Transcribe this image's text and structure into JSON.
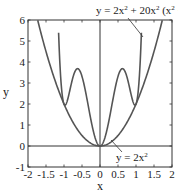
{
  "chart_data": {
    "type": "line",
    "title": "",
    "xlabel": "x",
    "ylabel": "y",
    "xlim": [
      -2,
      2
    ],
    "ylim": [
      -1,
      6
    ],
    "grid": false,
    "xticks": [
      "-2",
      "-1.5",
      "-1",
      "-0.5",
      "0",
      "0.5",
      "1",
      "1.5",
      "2"
    ],
    "yticks": [
      "-1",
      "0",
      "1",
      "2",
      "3",
      "4",
      "5",
      "6"
    ],
    "series": [
      {
        "name": "y = 2x² + 20x² (x² − 1)²",
        "expression": "2*x^2 + 20*x^2*(x^2-1)^2",
        "x": [
          -1.15,
          -1.1,
          -1.0,
          -0.9,
          -0.8,
          -0.7,
          -0.58,
          -0.5,
          -0.4,
          -0.3,
          -0.2,
          -0.1,
          0,
          0.1,
          0.2,
          0.3,
          0.4,
          0.5,
          0.58,
          0.7,
          0.8,
          0.9,
          1.0,
          1.1,
          1.15
        ],
        "values": [
          6.0,
          3.49,
          2.0,
          2.07,
          2.32,
          2.5,
          3.63,
          3.31,
          2.7,
          1.67,
          0.82,
          0.22,
          0,
          0.22,
          0.82,
          1.67,
          2.7,
          3.31,
          3.63,
          2.5,
          2.32,
          2.07,
          2.0,
          3.49,
          6.0
        ]
      },
      {
        "name": "y = 2x²",
        "expression": "2*x^2",
        "x": [
          -1.73,
          -1.5,
          -1.0,
          -0.5,
          0,
          0.5,
          1.0,
          1.5,
          1.73
        ],
        "values": [
          6.0,
          4.5,
          2.0,
          0.5,
          0,
          0.5,
          2.0,
          4.5,
          6.0
        ]
      }
    ],
    "annotations": [
      {
        "text": "y = 2x² + 20x² (x² − 1)²",
        "x": 1.15,
        "y": 5.0
      },
      {
        "text": "y = 2x²",
        "x": 0.4,
        "y": 0.3
      }
    ],
    "reference_lines": [
      {
        "orientation": "horizontal",
        "value": 0
      },
      {
        "orientation": "vertical",
        "value": 0
      }
    ]
  },
  "labels": {
    "top_annotation_prefix": "y = 2x",
    "top_annotation_mid": " + 20x",
    "top_annotation_paren": " (x",
    "top_annotation_tail": " − 1)",
    "sup2": "2",
    "bottom_annotation_prefix": "y = 2x",
    "xlabel": "x",
    "ylabel": "y"
  },
  "colors": {
    "curve": "#555555",
    "axes": "#333333",
    "text": "#1a1a1a"
  }
}
